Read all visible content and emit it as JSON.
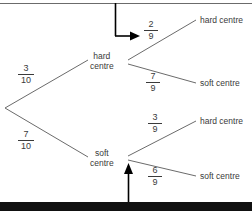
{
  "diagram": {
    "type": "probability-tree",
    "title": "",
    "stroke_color": "#6b6b6b",
    "text_color": "#3a3a3a",
    "pointer_color": "#000000",
    "root": {
      "x": 5,
      "y": 108
    },
    "branches": [
      {
        "id": "branch-hard",
        "label": "hard centre",
        "label_line1": "hard",
        "label_line2": "centre",
        "probability_numerator": "3",
        "probability_denominator": "10",
        "probability": "3/10",
        "node_x": 92,
        "node_y": 62,
        "frac_x": 24,
        "frac_y": 64,
        "children": [
          {
            "id": "leaf-hard-hard",
            "label": "hard centre",
            "probability_numerator": "2",
            "probability_denominator": "9",
            "probability": "2/9",
            "leaf_x": 200,
            "leaf_y": 18,
            "frac_x": 148,
            "frac_y": 20
          },
          {
            "id": "leaf-hard-soft",
            "label": "soft centre",
            "probability_numerator": "7",
            "probability_denominator": "9",
            "probability": "7/9",
            "leaf_x": 200,
            "leaf_y": 81,
            "frac_x": 148,
            "frac_y": 72
          }
        ]
      },
      {
        "id": "branch-soft",
        "label": "soft centre",
        "label_line1": "soft",
        "label_line2": "centre",
        "probability_numerator": "7",
        "probability_denominator": "10",
        "probability": "7/10",
        "node_x": 92,
        "node_y": 158,
        "frac_x": 24,
        "frac_y": 130,
        "children": [
          {
            "id": "leaf-soft-hard",
            "label": "hard centre",
            "probability_numerator": "3",
            "probability_denominator": "9",
            "probability": "3/9",
            "leaf_x": 200,
            "leaf_y": 119,
            "frac_x": 148,
            "frac_y": 113
          },
          {
            "id": "leaf-soft-soft",
            "label": "soft centre",
            "probability_numerator": "6",
            "probability_denominator": "9",
            "probability": "6/9",
            "leaf_x": 200,
            "leaf_y": 174,
            "frac_x": 148,
            "frac_y": 166
          }
        ]
      }
    ],
    "annotations": [
      {
        "id": "top-pointer",
        "shape": "elbow-arrow-right",
        "description": "arrow from top border pointing right to the 2/9 fraction",
        "from_x": 115,
        "from_y": 0,
        "corner_x": 115,
        "corner_y": 36,
        "to_x": 140,
        "to_y": 36
      },
      {
        "id": "bottom-pointer",
        "shape": "arrow-up",
        "description": "arrow from bottom bar pointing up toward the soft centre node",
        "from_x": 128,
        "from_y": 200,
        "to_x": 128,
        "to_y": 164
      }
    ],
    "frames": [
      {
        "id": "top-rule",
        "description": "thin horizontal rule along the top edge",
        "x": 0,
        "y": 3,
        "width": 252,
        "thickness": 1
      },
      {
        "id": "bottom-bar",
        "description": "thick black bar along the bottom edge",
        "x": 0,
        "y": 202,
        "width": 252,
        "thickness": 6
      }
    ]
  }
}
